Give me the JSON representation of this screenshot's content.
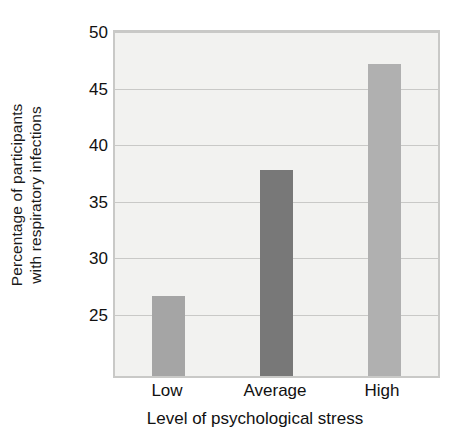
{
  "chart_data": {
    "type": "bar",
    "title": "",
    "subtitle": "",
    "categories": [
      "Low",
      "Average",
      "High"
    ],
    "values": [
      26.7,
      37.8,
      47.2
    ],
    "series": [
      {
        "name": "Percentage of participants with respiratory infections",
        "values": [
          26.7,
          37.8,
          47.2
        ]
      }
    ],
    "xlabel": "Level of psychological stress",
    "ylabel": "Percentage of participants with respiratory infections",
    "ylabel_lines": [
      "Percentage of participants",
      "with respiratory infections"
    ],
    "ylim": [
      19.6,
      50
    ],
    "ytick_labels": [
      "50",
      "45",
      "40",
      "35",
      "30",
      "25"
    ],
    "ytick_values": [
      50,
      45,
      40,
      35,
      30,
      25
    ],
    "grid": true,
    "legend": false,
    "legend_position": "none",
    "bar_colors": [
      "#a5a5a5",
      "#787878",
      "#b0b0b0"
    ],
    "plot_background": "#f2f2f0",
    "grid_color": "#c9c9c7",
    "axis_color": "#c9c9c7",
    "text_color": "#111111"
  }
}
